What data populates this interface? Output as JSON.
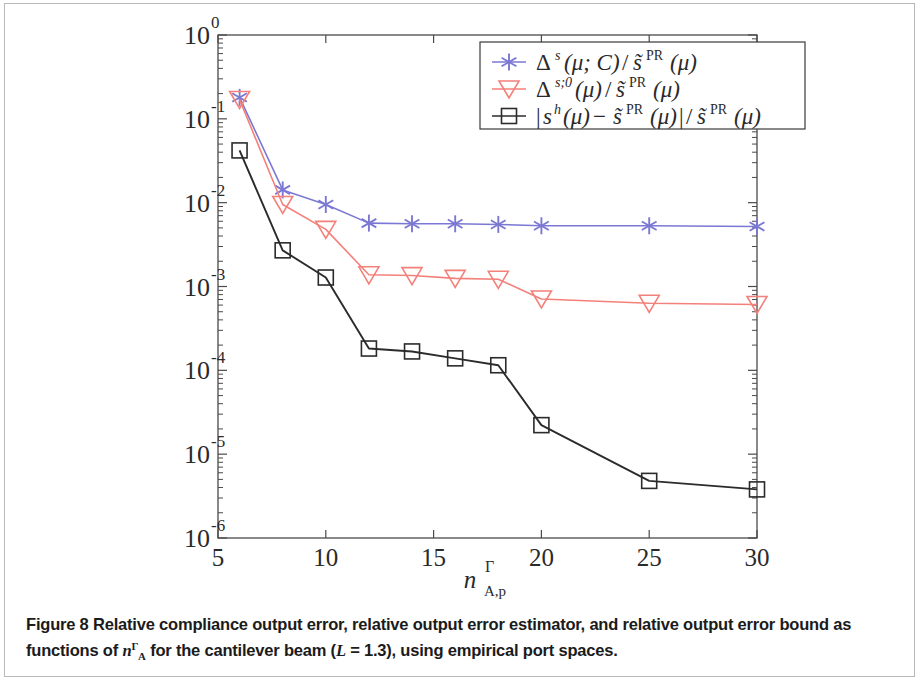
{
  "figure": {
    "caption_label": "Figure 8",
    "caption_text_part1": "Relative compliance output error, relative output error estimator, and relative output error bound as functions of ",
    "caption_math_n": "n",
    "caption_math_sup": "Γ",
    "caption_math_sub": "A",
    "caption_text_part2": " for the cantilever beam (",
    "caption_math_L": "L",
    "caption_text_eq": " = 1.3), using empirical port spaces.",
    "border_color": "#b9babc",
    "background_color": "#ffffff"
  },
  "chart_data": {
    "type": "line",
    "title": "",
    "xlabel": "n^Γ_{A,p}",
    "ylabel": "",
    "xscale": "linear",
    "yscale": "log",
    "xlim": [
      5,
      30
    ],
    "ylim": [
      1e-06,
      1
    ],
    "grid": false,
    "legend_position": "top-right",
    "x_ticks": [
      5,
      10,
      15,
      20,
      25,
      30
    ],
    "x_tick_labels": [
      "5",
      "10",
      "15",
      "20",
      "25",
      "30"
    ],
    "y_ticks": [
      1,
      0.1,
      0.01,
      0.001,
      0.0001,
      1e-05,
      1e-06
    ],
    "y_tick_labels": [
      "10^0",
      "10^-1",
      "10^-2",
      "10^-3",
      "10^-4",
      "10^-5",
      "10^-6"
    ],
    "y_tick_exponents": [
      "0",
      "-1",
      "-2",
      "-3",
      "-4",
      "-5",
      "-6"
    ],
    "x": [
      6,
      8,
      10,
      12,
      14,
      16,
      18,
      20,
      25,
      30
    ],
    "series": [
      {
        "name": "estimator",
        "legend_label": "Δ^s(μ; C) / ŝ^PR(μ)",
        "color": "#7b78d4",
        "marker": "asterisk",
        "values": [
          0.18,
          0.0142,
          0.0095,
          0.0057,
          0.0056,
          0.0056,
          0.0055,
          0.0053,
          0.0053,
          0.0052
        ]
      },
      {
        "name": "bound",
        "legend_label": "Δ^{s;0}(μ) / ŝ^PR(μ)",
        "color": "#f4807a",
        "marker": "triangle-down",
        "values": [
          0.17,
          0.0095,
          0.0048,
          0.00138,
          0.00135,
          0.00125,
          0.00122,
          0.00071,
          0.00063,
          0.00061
        ]
      },
      {
        "name": "true-error",
        "legend_label": "|s^h(μ) - ŝ^PR(μ)| / ŝ^PR(μ)",
        "color": "#2b2b2b",
        "marker": "square",
        "values": [
          0.042,
          0.0027,
          0.00128,
          0.000182,
          0.000168,
          0.000139,
          0.000115,
          2.22e-05,
          4.8e-06,
          3.8e-06
        ]
      }
    ]
  },
  "legend": {
    "entries": [
      {
        "delta": "Δ",
        "delta_sup": "s",
        "args": "(μ; C)",
        "slash": "/",
        "stilde": "s̃",
        "stilde_sup": "PR",
        "stilde_args": "(μ)"
      },
      {
        "delta": "Δ",
        "delta_sup": "s;0",
        "args": "(μ)",
        "slash": "/",
        "stilde": "s̃",
        "stilde_sup": "PR",
        "stilde_args": "(μ)"
      },
      {
        "bar_open": "|",
        "sh": "s",
        "sh_sup": "h",
        "sh_args": "(μ)",
        "minus": "−",
        "stilde": "s̃",
        "stilde_sup": "PR",
        "stilde_args": "(μ)",
        "bar_close": "|",
        "slash": "/",
        "stilde2": "s̃",
        "stilde2_sup": "PR",
        "stilde2_args": "(μ)"
      }
    ]
  },
  "axis": {
    "x_label_n": "n",
    "x_label_sup": "Γ",
    "x_label_sub": "A,p",
    "y_base": "10"
  }
}
